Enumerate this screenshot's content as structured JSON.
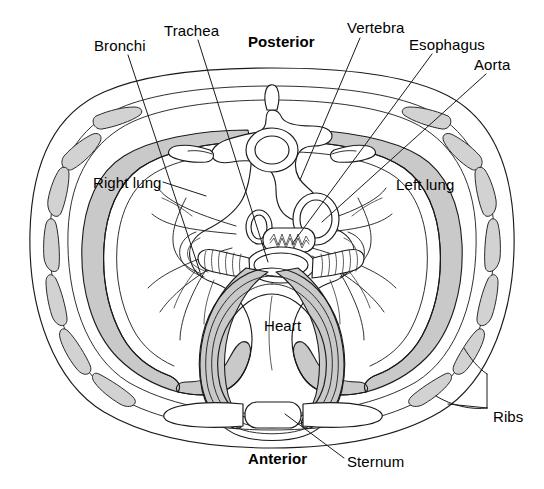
{
  "figure": {
    "background_color": "#ffffff",
    "outline_color": "#1b1b1b",
    "shading_color": "#c9c9c9",
    "width": 544,
    "height": 489
  },
  "labels": {
    "bronchi": "Bronchi",
    "trachea": "Trachea",
    "posterior": "Posterior",
    "vertebra": "Vertebra",
    "esophagus": "Esophagus",
    "aorta": "Aorta",
    "right_lung": "Right lung",
    "left_lung": "Left lung",
    "heart": "Heart",
    "ribs": "Ribs",
    "anterior": "Anterior",
    "sternum": "Sternum"
  },
  "label_positions": {
    "bronchi": {
      "x": 94,
      "y": 38
    },
    "trachea": {
      "x": 164,
      "y": 23
    },
    "posterior": {
      "x": 248,
      "y": 34
    },
    "vertebra": {
      "x": 347,
      "y": 20
    },
    "esophagus": {
      "x": 409,
      "y": 37
    },
    "aorta": {
      "x": 474,
      "y": 57
    },
    "right_lung": {
      "x": 93,
      "y": 175
    },
    "left_lung": {
      "x": 396,
      "y": 177
    },
    "heart": {
      "x": 264,
      "y": 318
    },
    "ribs": {
      "x": 493,
      "y": 409
    },
    "anterior": {
      "x": 248,
      "y": 451
    },
    "sternum": {
      "x": 347,
      "y": 454
    }
  },
  "structures": [
    "body-wall",
    "ribs",
    "sternum",
    "costal-cartilage",
    "vertebra",
    "spinal-cord-canal",
    "right-lung",
    "left-lung",
    "heart",
    "trachea",
    "bronchi",
    "esophagus",
    "aorta",
    "pulmonary-vessels"
  ],
  "orientation": {
    "top": "Posterior",
    "bottom": "Anterior"
  }
}
